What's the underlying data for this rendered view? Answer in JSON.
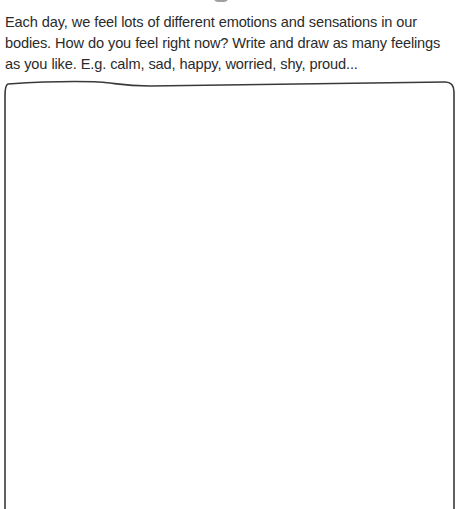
{
  "page": {
    "title_fragment_visible": true,
    "prompt": {
      "text": "Each day, we feel lots of different emotions and sensations in our bodies. How do you feel right now? Write and draw as many feelings as you like. E.g. calm, sad, happy, worried, shy, proud..."
    },
    "drawing_box": {
      "stroke_color": "#3a3a3a",
      "background": "#ffffff"
    }
  }
}
